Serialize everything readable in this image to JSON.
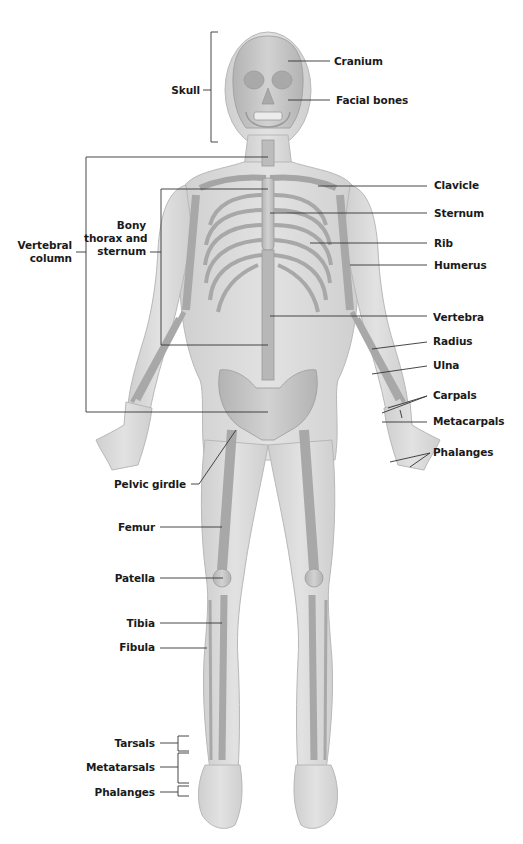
{
  "figure": {
    "type": "anatomical-diagram",
    "colors": {
      "skin": "#d9d9d9",
      "skin_edge": "#b5b5b5",
      "bone": "#c4c4c4",
      "bone_edge": "#9a9a9a",
      "leader_line": "#333333",
      "label_text": "#1a1a1a",
      "background": "#ffffff"
    }
  },
  "labels": {
    "left": {
      "skull": "Skull",
      "vertebral_column": "Vertebral\ncolumn",
      "bony_thorax": "Bony\nthorax and\nsternum",
      "pelvic_girdle": "Pelvic girdle",
      "femur": "Femur",
      "patella": "Patella",
      "tibia": "Tibia",
      "fibula": "Fibula",
      "tarsals": "Tarsals",
      "metatarsals": "Metatarsals",
      "foot_phalanges": "Phalanges"
    },
    "right": {
      "cranium": "Cranium",
      "facial_bones": "Facial bones",
      "clavicle": "Clavicle",
      "sternum": "Sternum",
      "rib": "Rib",
      "humerus": "Humerus",
      "vertebra": "Vertebra",
      "radius": "Radius",
      "ulna": "Ulna",
      "carpals": "Carpals",
      "metacarpals": "Metacarpals",
      "hand_phalanges": "Phalanges"
    }
  }
}
